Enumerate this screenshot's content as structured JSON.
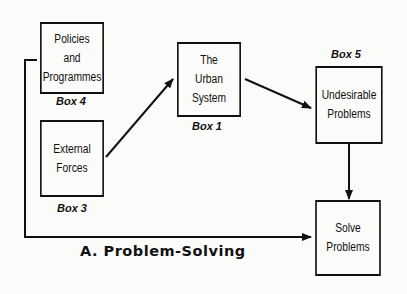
{
  "diagram": {
    "title": "A. Problem-Solving",
    "boxes": [
      {
        "id": "box4",
        "lines": [
          "Policies",
          "and",
          "Programmes"
        ],
        "label": "Box 4"
      },
      {
        "id": "box3",
        "lines": [
          "External",
          "Forces"
        ],
        "label": "Box 3"
      },
      {
        "id": "box1",
        "lines": [
          "The",
          "Urban",
          "System"
        ],
        "label": "Box 1"
      },
      {
        "id": "box5",
        "lines": [
          "Undesirable",
          "Problems"
        ],
        "label": "Box 5"
      },
      {
        "id": "solve",
        "lines": [
          "Solve",
          "Problems"
        ],
        "label": ""
      }
    ],
    "edges": [
      {
        "from": "box3",
        "to": "box1"
      },
      {
        "from": "box1",
        "to": "box5"
      },
      {
        "from": "box5",
        "to": "solve"
      },
      {
        "from": "box4",
        "to": "solve"
      }
    ]
  }
}
